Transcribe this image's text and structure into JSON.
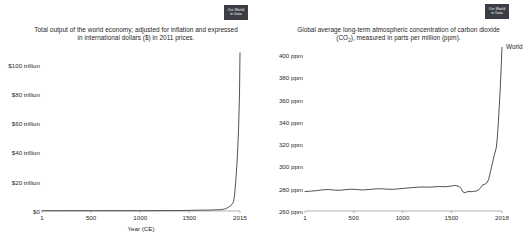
{
  "page": {
    "background": "#ffffff",
    "width": 529,
    "height": 241
  },
  "branding": {
    "badge_line1": "Our World",
    "badge_line2": "in Data"
  },
  "panels": {
    "gdp": {
      "title_line1": "Total output of the world economy; adjusted for inflation and expressed",
      "title_line2_pre": "in international dollars ($) in 2011 prices.",
      "xlabel": "Year (CE)"
    },
    "co2": {
      "title_line1_pre": "Global average long-term atmospheric concentration of carbon dioxide (CO",
      "title_line1_sub": "2",
      "title_line1_post": "),",
      "title_line2": "measured in parts per million (ppm).",
      "series_label": "World"
    }
  },
  "chart_data": [
    {
      "id": "world-gdp",
      "type": "line",
      "title": "Total output of the world economy; adjusted for inflation and expressed in international dollars ($) in 2011 prices.",
      "xlabel": "Year (CE)",
      "ylabel": "",
      "xlim": [
        1,
        2015
      ],
      "ylim": [
        0,
        110
      ],
      "grid": false,
      "legend_position": "none",
      "xticks": [
        1,
        500,
        1000,
        1500,
        2015
      ],
      "xtick_labels": [
        "1",
        "500",
        "1000",
        "1500",
        "2015"
      ],
      "yticks": [
        0,
        20,
        40,
        60,
        80,
        100
      ],
      "ytick_labels": [
        "$0",
        "$20 trillion",
        "$40 trillion",
        "$60 trillion",
        "$80 trillion",
        "$100 trillion"
      ],
      "y_units": "trillion international dollars (2011 prices)",
      "series": [
        {
          "name": "World",
          "color": "#3d3d3d",
          "x": [
            1,
            200,
            400,
            600,
            800,
            1000,
            1100,
            1200,
            1300,
            1400,
            1500,
            1600,
            1700,
            1750,
            1800,
            1820,
            1850,
            1870,
            1900,
            1920,
            1940,
            1950,
            1960,
            1970,
            1980,
            1990,
            2000,
            2010,
            2015
          ],
          "values": [
            0.18,
            0.2,
            0.2,
            0.21,
            0.22,
            0.21,
            0.23,
            0.26,
            0.28,
            0.3,
            0.43,
            0.55,
            0.64,
            0.73,
            0.9,
            0.98,
            1.25,
            1.6,
            2.7,
            3.6,
            5.2,
            6.5,
            11.0,
            19.0,
            28.0,
            39.0,
            55.0,
            80.0,
            108.0
          ]
        }
      ]
    },
    {
      "id": "co2-concentration",
      "type": "line",
      "title": "Global average long-term atmospheric concentration of carbon dioxide (CO2), measured in parts per million (ppm).",
      "xlabel": "",
      "ylabel": "ppm",
      "xlim": [
        1,
        2018
      ],
      "ylim": [
        260,
        410
      ],
      "grid": false,
      "legend_position": "right",
      "xticks": [
        1,
        500,
        1000,
        1500,
        2018
      ],
      "xtick_labels": [
        "1",
        "500",
        "1000",
        "1500",
        "2018"
      ],
      "yticks": [
        260,
        280,
        300,
        320,
        340,
        360,
        380,
        400
      ],
      "ytick_labels": [
        "260 ppm",
        "280 ppm",
        "300 ppm",
        "320 ppm",
        "340 ppm",
        "360 ppm",
        "380 ppm",
        "400 ppm"
      ],
      "series": [
        {
          "name": "World",
          "color": "#3d3d3d",
          "x": [
            1,
            60,
            120,
            180,
            240,
            300,
            360,
            420,
            480,
            540,
            600,
            660,
            720,
            780,
            840,
            900,
            960,
            1020,
            1080,
            1140,
            1200,
            1260,
            1320,
            1380,
            1440,
            1500,
            1540,
            1580,
            1600,
            1620,
            1640,
            1660,
            1680,
            1700,
            1720,
            1740,
            1760,
            1780,
            1800,
            1820,
            1840,
            1860,
            1880,
            1900,
            1920,
            1940,
            1960,
            1970,
            1980,
            1990,
            2000,
            2010,
            2018
          ],
          "values": [
            277.5,
            277.8,
            278.3,
            279.0,
            279.3,
            278.8,
            278.6,
            279.2,
            279.6,
            279.2,
            278.9,
            279.4,
            279.8,
            280.0,
            279.6,
            279.5,
            279.9,
            280.4,
            280.9,
            281.3,
            281.6,
            281.4,
            281.7,
            282.0,
            281.8,
            282.4,
            283.0,
            282.0,
            280.0,
            277.0,
            276.3,
            277.2,
            277.6,
            277.3,
            277.5,
            277.8,
            278.0,
            279.0,
            281.0,
            283.5,
            284.0,
            285.0,
            288.0,
            295.5,
            303.0,
            310.5,
            317.0,
            325.7,
            338.8,
            354.4,
            369.7,
            389.9,
            407.0
          ]
        }
      ]
    }
  ]
}
